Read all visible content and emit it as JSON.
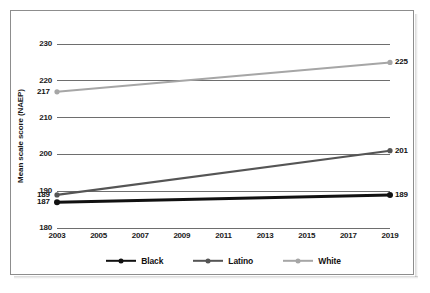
{
  "chart_data": {
    "type": "line",
    "title": "",
    "xlabel": "",
    "ylabel": "Mean scale score (NAEP)",
    "x": [
      2003,
      2005,
      2007,
      2009,
      2011,
      2013,
      2015,
      2017,
      2019
    ],
    "xtick_labels": [
      "2003",
      "2005",
      "2007",
      "2009",
      "2011",
      "2013",
      "2015",
      "2017",
      "2019"
    ],
    "xlim": [
      2003,
      2019
    ],
    "ylim": [
      180,
      230
    ],
    "ytick_labels": [
      "230",
      "220",
      "210",
      "200",
      "190",
      "180"
    ],
    "yticks": [
      230,
      220,
      210,
      200,
      190,
      180
    ],
    "grid": true,
    "legend_position": "bottom-center",
    "series": [
      {
        "name": "Black",
        "color": "#111111",
        "points": [
          {
            "x": 2003,
            "y": 187,
            "label": "187",
            "label_side": "left"
          },
          {
            "x": 2019,
            "y": 189,
            "label": "189",
            "label_side": "right"
          }
        ]
      },
      {
        "name": "Latino",
        "color": "#555555",
        "points": [
          {
            "x": 2003,
            "y": 189,
            "label": "189",
            "label_side": "left"
          },
          {
            "x": 2019,
            "y": 201,
            "label": "201",
            "label_side": "right"
          }
        ]
      },
      {
        "name": "White",
        "color": "#a6a6a6",
        "points": [
          {
            "x": 2003,
            "y": 217,
            "label": "217",
            "label_side": "left"
          },
          {
            "x": 2019,
            "y": 225,
            "label": "225",
            "label_side": "right"
          }
        ]
      }
    ],
    "legend": [
      {
        "label": "Black",
        "color": "#111111"
      },
      {
        "label": "Latino",
        "color": "#555555"
      },
      {
        "label": "White",
        "color": "#a6a6a6"
      }
    ]
  }
}
